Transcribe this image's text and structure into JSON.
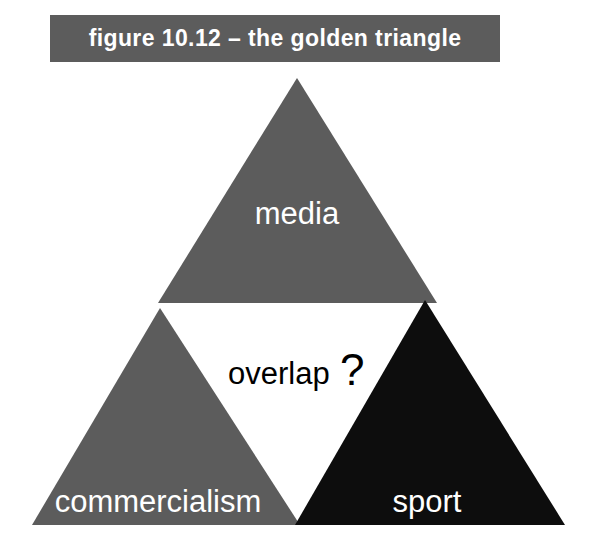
{
  "caption": {
    "text": "figure 10.12 – the golden triangle",
    "background_color": "#5c5c5c",
    "text_color": "#ffffff"
  },
  "diagram": {
    "name": "the golden triangle",
    "background_color": "#ffffff",
    "triangles": [
      {
        "id": "media",
        "label": "media",
        "position": "top",
        "fill": "#5c5c5c",
        "label_color": "#ffffff"
      },
      {
        "id": "commercialism",
        "label": "commercialism",
        "position": "bottom-left",
        "fill": "#5c5c5c",
        "label_color": "#ffffff"
      },
      {
        "id": "sport",
        "label": "sport",
        "position": "bottom-right",
        "fill": "#0d0d0d",
        "label_color": "#ffffff"
      }
    ],
    "center": {
      "label": "overlap",
      "marker": "?",
      "text_color": "#000000"
    }
  }
}
